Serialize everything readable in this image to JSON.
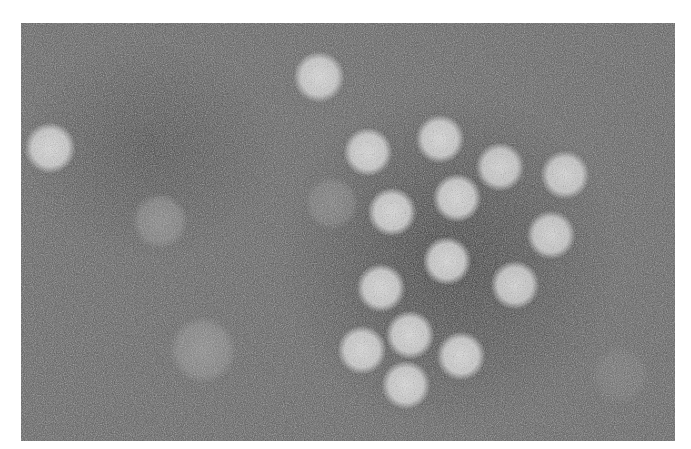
{
  "image": {
    "kind": "transmission electron micrograph (negative stain)",
    "subject": "icosahedral virus particles",
    "frame": {
      "x": 21,
      "y": 23,
      "width": 654,
      "height": 418
    },
    "background_gray": "#5a5a5a",
    "particle_color": "#dcdcdc"
  },
  "particles": [
    {
      "cx": 319,
      "cy": 77,
      "r": 23,
      "opacity": 0.95
    },
    {
      "cx": 50,
      "cy": 148,
      "r": 23,
      "opacity": 0.95
    },
    {
      "cx": 368,
      "cy": 152,
      "r": 22,
      "opacity": 0.95
    },
    {
      "cx": 440,
      "cy": 139,
      "r": 22,
      "opacity": 0.95
    },
    {
      "cx": 500,
      "cy": 167,
      "r": 22,
      "opacity": 0.92
    },
    {
      "cx": 565,
      "cy": 175,
      "r": 22,
      "opacity": 0.92
    },
    {
      "cx": 457,
      "cy": 198,
      "r": 22,
      "opacity": 0.95
    },
    {
      "cx": 392,
      "cy": 212,
      "r": 22,
      "opacity": 0.95
    },
    {
      "cx": 551,
      "cy": 235,
      "r": 22,
      "opacity": 0.92
    },
    {
      "cx": 447,
      "cy": 261,
      "r": 22,
      "opacity": 0.95
    },
    {
      "cx": 515,
      "cy": 285,
      "r": 22,
      "opacity": 0.92
    },
    {
      "cx": 381,
      "cy": 288,
      "r": 22,
      "opacity": 0.95
    },
    {
      "cx": 410,
      "cy": 335,
      "r": 22,
      "opacity": 0.95
    },
    {
      "cx": 362,
      "cy": 350,
      "r": 22,
      "opacity": 0.95
    },
    {
      "cx": 461,
      "cy": 356,
      "r": 22,
      "opacity": 0.95
    },
    {
      "cx": 406,
      "cy": 385,
      "r": 22,
      "opacity": 0.95
    }
  ],
  "ghost_particles": [
    {
      "cx": 160,
      "cy": 221,
      "r": 25,
      "opacity": 0.45
    },
    {
      "cx": 332,
      "cy": 203,
      "r": 24,
      "opacity": 0.35
    },
    {
      "cx": 203,
      "cy": 350,
      "r": 30,
      "opacity": 0.45
    },
    {
      "cx": 620,
      "cy": 375,
      "r": 26,
      "opacity": 0.18
    }
  ]
}
